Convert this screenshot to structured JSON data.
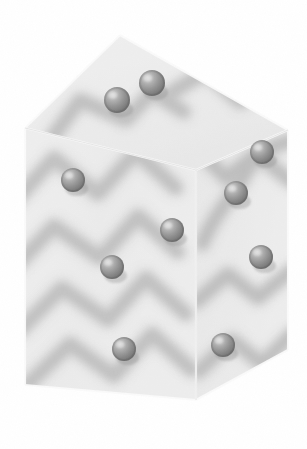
{
  "figure": {
    "kind": "3d-rendered-illustration",
    "canvas": {
      "width": 307,
      "height": 449,
      "background": "#ffffff"
    },
    "palette": {
      "background": "#ffffff",
      "cell_top_face": "#e8e8e8",
      "cell_left_face": "#ededed",
      "cell_right_face": "#e4e4e4",
      "cell_edge": "#f7f7f7",
      "sphere_base": "#8d8d8d",
      "sphere_highlight": "#e2e2e2",
      "sphere_shadow": "#6a6a6a",
      "chain_blur": "#9a9a9a"
    },
    "box": {
      "name": "unit-cell",
      "projection": "oblique",
      "vertices": {
        "top_back": [
          120,
          35
        ],
        "top_left": [
          25,
          128
        ],
        "top_front": [
          196,
          170
        ],
        "top_right": [
          288,
          130
        ],
        "bottom_left": [
          25,
          385
        ],
        "bottom_front": [
          196,
          400
        ],
        "bottom_right": [
          288,
          350
        ]
      },
      "faces": [
        {
          "name": "top-face",
          "points": "120,35 25,128 196,170 288,130"
        },
        {
          "name": "left-face",
          "points": "25,128 196,170 196,400 25,385"
        },
        {
          "name": "right-face",
          "points": "196,170 288,130 288,350 196,400"
        }
      ]
    },
    "spheres": [
      {
        "id": 1,
        "cx": 152,
        "cy": 83,
        "r": 13,
        "face": "top"
      },
      {
        "id": 2,
        "cx": 117,
        "cy": 100,
        "r": 13,
        "face": "top"
      },
      {
        "id": 3,
        "cx": 262,
        "cy": 152,
        "r": 12,
        "face": "right"
      },
      {
        "id": 4,
        "cx": 73,
        "cy": 180,
        "r": 12,
        "face": "left"
      },
      {
        "id": 5,
        "cx": 236,
        "cy": 193,
        "r": 12,
        "face": "right"
      },
      {
        "id": 6,
        "cx": 172,
        "cy": 230,
        "r": 12,
        "face": "left"
      },
      {
        "id": 7,
        "cx": 261,
        "cy": 257,
        "r": 12,
        "face": "right"
      },
      {
        "id": 8,
        "cx": 112,
        "cy": 267,
        "r": 12,
        "face": "left"
      },
      {
        "id": 9,
        "cx": 124,
        "cy": 349,
        "r": 12,
        "face": "left"
      },
      {
        "id": 10,
        "cx": 223,
        "cy": 345,
        "r": 12,
        "face": "right"
      }
    ],
    "chains": [
      {
        "id": "chain-top-left",
        "points": "62,130 84,104 124,118 150,96 176,110"
      },
      {
        "id": "chain-top-right",
        "points": "176,96 206,78 238,100 268,84 286,104"
      },
      {
        "id": "chain-left-upper",
        "points": "28,196 56,164 96,188 134,156 170,184"
      },
      {
        "id": "chain-left-mid",
        "points": "24,260 56,228 98,252 136,220 172,248"
      },
      {
        "id": "chain-left-lower",
        "points": "30,320 62,288 104,312 142,282 178,308"
      },
      {
        "id": "chain-left-bottom",
        "points": "34,372 70,344 112,368 150,338 186,362"
      },
      {
        "id": "chain-right-upper",
        "points": "200,150 228,176 258,156 286,180"
      },
      {
        "id": "chain-right-s",
        "points": "206,226 232,204 250,176 272,150 288,142"
      },
      {
        "id": "chain-right-lower",
        "points": "202,300 230,276 258,296 286,272"
      },
      {
        "id": "chain-right-bottom",
        "points": "206,366 234,340 262,360 288,336"
      }
    ],
    "labels": {
      "figure_caption": "",
      "axis_labels": []
    }
  }
}
